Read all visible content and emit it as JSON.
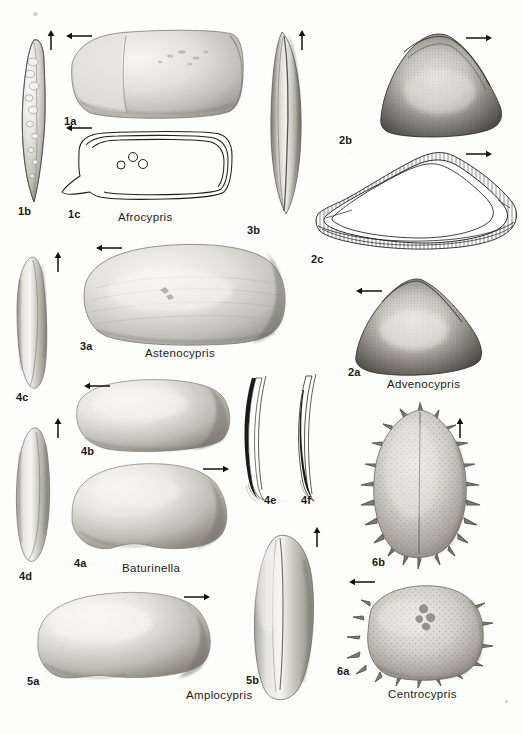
{
  "plate": {
    "kind": "scientific-illustration-plate",
    "subject": "ostracod-carapace-views",
    "background_color": "#fdfdfb",
    "ink_color": "#1a1a1a",
    "width": 522,
    "height": 735
  },
  "genera": [
    {
      "id": "g1",
      "name": "Afrocypris",
      "label_x": 118,
      "label_y": 212,
      "figures": [
        {
          "label": "1a",
          "label_x": 64,
          "label_y": 116,
          "view": "lateral-external-photo"
        },
        {
          "label": "1b",
          "label_x": 18,
          "label_y": 206,
          "view": "dorsal-relief-photo"
        },
        {
          "label": "1c",
          "label_x": 68,
          "label_y": 209,
          "view": "outline-drawing-with-muscle-scars"
        }
      ]
    },
    {
      "id": "g2",
      "name": "Advenocypris",
      "label_x": 387,
      "label_y": 379,
      "figures": [
        {
          "label": "2b",
          "label_x": 339,
          "label_y": 135,
          "view": "lateral-stippled-photo"
        },
        {
          "label": "2c",
          "label_x": 311,
          "label_y": 254,
          "view": "outline-drawing-with-marginal-zone"
        },
        {
          "label": "2a",
          "label_x": 348,
          "label_y": 367,
          "view": "lateral-stippled-photo"
        }
      ]
    },
    {
      "id": "g3",
      "name": "Astenocypris",
      "label_x": 145,
      "label_y": 348,
      "figures": [
        {
          "label": "3b",
          "label_x": 247,
          "label_y": 225,
          "view": "dorsal-photo"
        },
        {
          "label": "3a",
          "label_x": 80,
          "label_y": 341,
          "view": "lateral-photo"
        }
      ]
    },
    {
      "id": "g4",
      "name": "Baturinella",
      "label_x": 122,
      "label_y": 563,
      "figures": [
        {
          "label": "4c",
          "label_x": 16,
          "label_y": 392,
          "view": "dorsal-photo"
        },
        {
          "label": "4b",
          "label_x": 81,
          "label_y": 446,
          "view": "lateral-photo"
        },
        {
          "label": "4a",
          "label_x": 74,
          "label_y": 558,
          "view": "lateral-photo"
        },
        {
          "label": "4d",
          "label_x": 19,
          "label_y": 571,
          "view": "dorsal-photo"
        },
        {
          "label": "4e",
          "label_x": 264,
          "label_y": 495,
          "view": "marginal-zone-section"
        },
        {
          "label": "4f",
          "label_x": 301,
          "label_y": 495,
          "view": "marginal-zone-section"
        }
      ]
    },
    {
      "id": "g5",
      "name": "Amplocypris",
      "label_x": 186,
      "label_y": 690,
      "figures": [
        {
          "label": "5a",
          "label_x": 27,
          "label_y": 676,
          "view": "lateral-photo"
        },
        {
          "label": "5b",
          "label_x": 246,
          "label_y": 675,
          "view": "dorsal-photo"
        }
      ]
    },
    {
      "id": "g6",
      "name": "Centrocypris",
      "label_x": 388,
      "label_y": 689,
      "figures": [
        {
          "label": "6b",
          "label_x": 372,
          "label_y": 557,
          "view": "dorsal-spiny-photo"
        },
        {
          "label": "6a",
          "label_x": 337,
          "label_y": 666,
          "view": "lateral-spiny-photo"
        }
      ]
    }
  ],
  "arrows": [
    {
      "id": "a1",
      "direction": "up",
      "x": 46,
      "y": 30,
      "length": 20,
      "for_figure": "1b"
    },
    {
      "id": "a2",
      "direction": "left",
      "x": 66,
      "y": 36,
      "length": 24,
      "for_figure": "1a"
    },
    {
      "id": "a3",
      "direction": "left",
      "x": 66,
      "y": 128,
      "length": 24,
      "for_figure": "1c"
    },
    {
      "id": "a4",
      "direction": "up",
      "x": 297,
      "y": 30,
      "length": 20,
      "for_figure": "3b"
    },
    {
      "id": "a5",
      "direction": "right",
      "x": 466,
      "y": 38,
      "length": 24,
      "for_figure": "2b"
    },
    {
      "id": "a6",
      "direction": "right",
      "x": 466,
      "y": 154,
      "length": 24,
      "for_figure": "2c"
    },
    {
      "id": "a7",
      "direction": "up",
      "x": 55,
      "y": 255,
      "length": 20,
      "for_figure": "4c"
    },
    {
      "id": "a8",
      "direction": "left",
      "x": 100,
      "y": 247,
      "length": 24,
      "for_figure": "3a"
    },
    {
      "id": "a9",
      "direction": "left",
      "x": 358,
      "y": 290,
      "length": 24,
      "for_figure": "2a"
    },
    {
      "id": "a10",
      "direction": "left",
      "x": 86,
      "y": 385,
      "length": 24,
      "for_figure": "4b"
    },
    {
      "id": "a11",
      "direction": "up",
      "x": 55,
      "y": 422,
      "length": 20,
      "for_figure": "4d"
    },
    {
      "id": "a12",
      "direction": "right",
      "x": 205,
      "y": 468,
      "length": 24,
      "for_figure": "4a"
    },
    {
      "id": "a13",
      "direction": "up",
      "x": 455,
      "y": 422,
      "length": 20,
      "for_figure": "6b"
    },
    {
      "id": "a14",
      "direction": "right",
      "x": 186,
      "y": 596,
      "length": 24,
      "for_figure": "5a"
    },
    {
      "id": "a15",
      "direction": "up",
      "x": 313,
      "y": 530,
      "length": 20,
      "for_figure": "5b"
    },
    {
      "id": "a16",
      "direction": "left",
      "x": 351,
      "y": 581,
      "length": 24,
      "for_figure": "6a"
    }
  ],
  "muscle_scars": {
    "figure": "1c",
    "count": 3,
    "positions": [
      {
        "cx": 121,
        "cy": 165,
        "r": 4
      },
      {
        "cx": 133,
        "cy": 157,
        "r": 4.5
      },
      {
        "cx": 143,
        "cy": 164,
        "r": 4.5
      }
    ]
  }
}
